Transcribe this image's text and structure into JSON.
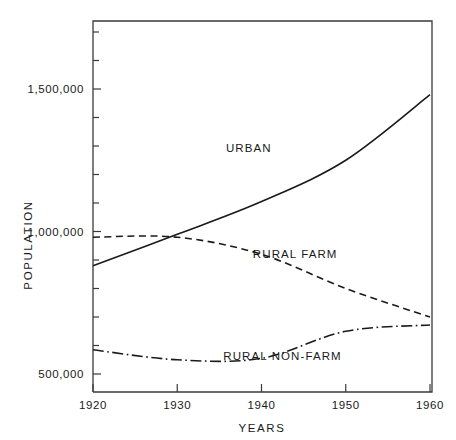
{
  "chart_data": {
    "type": "line",
    "title": "",
    "xlabel": "YEARS",
    "ylabel": "POPULATION",
    "x": [
      1920,
      1930,
      1940,
      1950,
      1960
    ],
    "categories": [
      "1920",
      "1930",
      "1940",
      "1950",
      "1960"
    ],
    "xlim": [
      1920,
      1960
    ],
    "ylim": [
      400000,
      1700000
    ],
    "grid": false,
    "legend_position": "inline-annotations",
    "y_tick_labels": [
      "1,500,000",
      "1,000,000",
      "500,000"
    ],
    "y_tick_values": [
      1500000,
      1000000,
      500000
    ],
    "y_minor_tick_values": [
      400000,
      500000,
      600000,
      700000,
      800000,
      900000,
      1000000,
      1100000,
      1200000,
      1300000,
      1400000,
      1500000,
      1600000,
      1700000
    ],
    "series": [
      {
        "name": "URBAN",
        "label": "URBAN",
        "style": "solid",
        "values": [
          880000,
          990000,
          1105000,
          1250000,
          1480000
        ]
      },
      {
        "name": "RURAL FARM",
        "label": "RURAL FARM",
        "style": "dashed",
        "values": [
          980000,
          980000,
          920000,
          800000,
          700000
        ]
      },
      {
        "name": "RURAL NON-FARM",
        "label": "RURAL NON-FARM",
        "style": "dash-dot",
        "values": [
          585000,
          550000,
          555000,
          650000,
          672000
        ]
      }
    ],
    "annotations": [
      {
        "text": "URBAN",
        "x": 1938.5,
        "y": 1278000
      },
      {
        "text": "RURAL FARM",
        "x": 1944.0,
        "y": 908000
      },
      {
        "text": "RURAL NON-FARM",
        "x": 1942.5,
        "y": 548000
      }
    ],
    "colors": {
      "line": "#1a1a1a",
      "frame": "#3a3a3a",
      "text": "#1a1a1a",
      "background": "#ffffff"
    }
  }
}
